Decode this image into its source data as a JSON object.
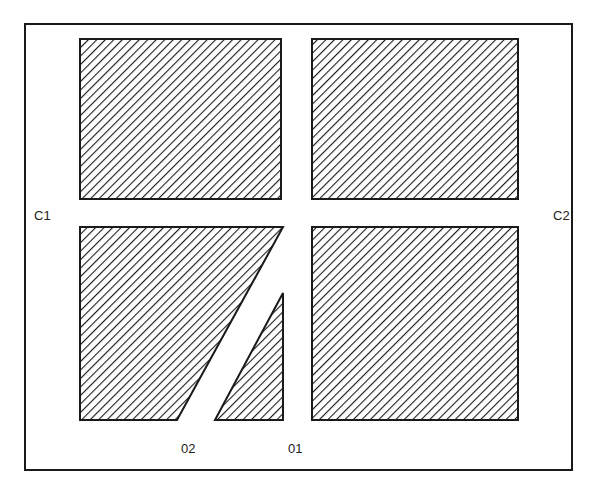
{
  "diagram": {
    "labels": {
      "c1": "C1",
      "c2": "C2",
      "o2": "02",
      "o1": "01"
    },
    "colors": {
      "stroke": "#1a1a1a",
      "hatch": "#1a1a1a",
      "background": "#ffffff"
    },
    "regions": [
      {
        "name": "top-left-block",
        "points": "80,39 281,39 281,199 80,199"
      },
      {
        "name": "top-right-block",
        "points": "312,39 518,39 518,199 312,199"
      },
      {
        "name": "bottom-left-trapezoid",
        "points": "80,227 283,227 177,420 80,420"
      },
      {
        "name": "bottom-middle-triangle",
        "points": "283,293 283,420 215,420"
      },
      {
        "name": "bottom-right-block",
        "points": "312,227 518,227 518,420 312,420"
      }
    ]
  }
}
